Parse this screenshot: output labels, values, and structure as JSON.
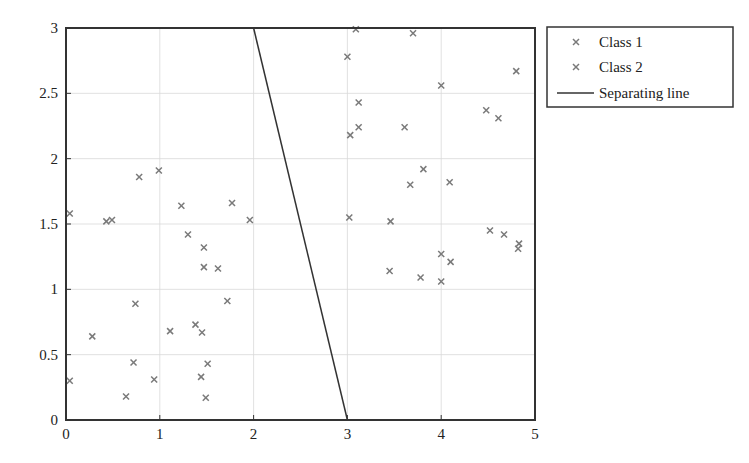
{
  "chart_data": {
    "type": "scatter",
    "title": "",
    "xlabel": "",
    "ylabel": "",
    "xlim": [
      0,
      5
    ],
    "ylim": [
      0,
      3
    ],
    "xticks": [
      0,
      1,
      2,
      3,
      4,
      5
    ],
    "yticks": [
      0,
      0.5,
      1,
      1.5,
      2,
      2.5,
      3
    ],
    "xtick_labels": [
      "0",
      "1",
      "2",
      "3",
      "4",
      "5"
    ],
    "ytick_labels": [
      "0",
      "0.5",
      "1",
      "1.5",
      "2",
      "2.5",
      "3"
    ],
    "grid": true,
    "legend_position": "outside upper right",
    "series": [
      {
        "name": "Class 1",
        "marker": "x",
        "color": "#7a7a7a",
        "points": [
          [
            0.04,
            0.3
          ],
          [
            0.04,
            1.58
          ],
          [
            0.28,
            0.64
          ],
          [
            0.43,
            1.52
          ],
          [
            0.49,
            1.53
          ],
          [
            0.78,
            1.86
          ],
          [
            0.99,
            1.91
          ],
          [
            0.72,
            0.44
          ],
          [
            0.74,
            0.89
          ],
          [
            0.64,
            0.18
          ],
          [
            0.94,
            0.31
          ],
          [
            1.11,
            0.68
          ],
          [
            1.23,
            1.64
          ],
          [
            1.3,
            1.42
          ],
          [
            1.38,
            0.73
          ],
          [
            1.45,
            0.67
          ],
          [
            1.47,
            1.32
          ],
          [
            1.47,
            1.17
          ],
          [
            1.44,
            0.33
          ],
          [
            1.51,
            0.43
          ],
          [
            1.49,
            0.17
          ],
          [
            1.62,
            1.16
          ],
          [
            1.72,
            0.91
          ],
          [
            1.77,
            1.66
          ],
          [
            1.96,
            1.53
          ]
        ]
      },
      {
        "name": "Class 2",
        "marker": "x",
        "color": "#7a7a7a",
        "points": [
          [
            3.0,
            2.78
          ],
          [
            3.09,
            2.99
          ],
          [
            3.7,
            2.96
          ],
          [
            3.03,
            2.18
          ],
          [
            3.12,
            2.24
          ],
          [
            3.12,
            2.43
          ],
          [
            3.61,
            2.24
          ],
          [
            4.0,
            2.56
          ],
          [
            4.48,
            2.37
          ],
          [
            4.61,
            2.31
          ],
          [
            4.8,
            2.67
          ],
          [
            3.02,
            1.55
          ],
          [
            3.46,
            1.52
          ],
          [
            3.67,
            1.8
          ],
          [
            3.81,
            1.92
          ],
          [
            4.09,
            1.82
          ],
          [
            4.52,
            1.45
          ],
          [
            4.67,
            1.42
          ],
          [
            4.83,
            1.35
          ],
          [
            4.82,
            1.31
          ],
          [
            4.0,
            1.27
          ],
          [
            4.1,
            1.21
          ],
          [
            3.45,
            1.14
          ],
          [
            3.78,
            1.09
          ],
          [
            4.0,
            1.06
          ]
        ]
      },
      {
        "name": "Separating line",
        "type": "line",
        "color": "#333333",
        "points": [
          [
            2,
            3
          ],
          [
            3,
            0
          ]
        ]
      }
    ]
  },
  "legend": {
    "items": [
      {
        "label": "Class 1",
        "kind": "marker"
      },
      {
        "label": "Class 2",
        "kind": "marker"
      },
      {
        "label": "Separating line",
        "kind": "line"
      }
    ]
  },
  "colors": {
    "axis": "#333333",
    "grid": "#d9d9d9",
    "marker": "#7a7a7a",
    "line": "#333333"
  }
}
